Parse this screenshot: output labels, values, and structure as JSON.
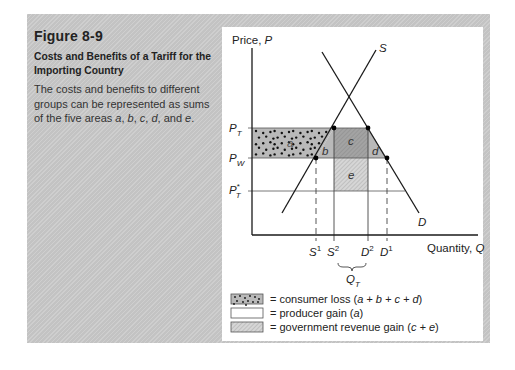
{
  "caption": {
    "figure_number": "Figure 8-9",
    "title_line1": "Costs and Benefits of a Tariff for the",
    "title_line2": "Importing Country",
    "description_prefix": "The costs and benefits to different groups can be represented as sums of the five areas ",
    "description_areas": [
      "a",
      "b",
      "c",
      "d"
    ],
    "description_and": " and ",
    "description_last": "e",
    "description_suffix": "."
  },
  "chart_data": {
    "type": "diagram",
    "title": "Costs and Benefits of a Tariff for the Importing Country",
    "ylabel": "Price, P",
    "xlabel": "Quantity, Q",
    "curves": [
      {
        "name": "S",
        "label": "S",
        "kind": "supply"
      },
      {
        "name": "D",
        "label": "D",
        "kind": "demand"
      }
    ],
    "price_levels": [
      {
        "name": "P_T",
        "label": "P",
        "sub": "T",
        "sup": ""
      },
      {
        "name": "P_W",
        "label": "P",
        "sub": "W",
        "sup": ""
      },
      {
        "name": "P_T*",
        "label": "P",
        "sub": "T",
        "sup": "*"
      }
    ],
    "quantity_levels": [
      {
        "name": "S1",
        "label": "S",
        "sup": "1"
      },
      {
        "name": "S2",
        "label": "S",
        "sup": "2"
      },
      {
        "name": "D2",
        "label": "D",
        "sup": "2"
      },
      {
        "name": "D1",
        "label": "D",
        "sup": "1"
      }
    ],
    "imports_label": {
      "label": "Q",
      "sub": "T"
    },
    "areas": [
      {
        "id": "a",
        "label": "a",
        "description": "producer gain"
      },
      {
        "id": "b",
        "label": "b",
        "description": "production distortion"
      },
      {
        "id": "c",
        "label": "c",
        "description": "government revenue from foreign"
      },
      {
        "id": "d",
        "label": "d",
        "description": "consumption distortion"
      },
      {
        "id": "e",
        "label": "e",
        "description": "terms of trade gain"
      }
    ],
    "legend": [
      {
        "swatch": "solid",
        "text": "= consumer loss (",
        "formula": "a + b + c + d",
        "close": ")"
      },
      {
        "swatch": "dots",
        "text": "= producer gain (",
        "formula": "a",
        "close": ")"
      },
      {
        "swatch": "hatch",
        "text": "= government revenue gain (",
        "formula": "c + e",
        "close": ")"
      }
    ],
    "colors": {
      "consumer_loss": "#b9b9b9",
      "hatch_light": "#d2d2d2",
      "c_area": "#9c9c9c",
      "lines": "#1a1a1a"
    }
  }
}
